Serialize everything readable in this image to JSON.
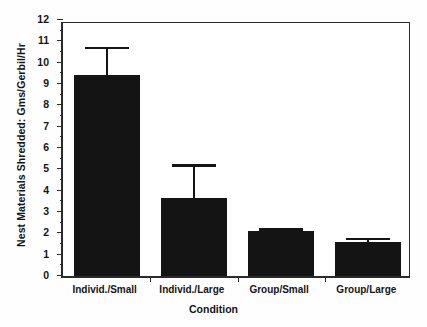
{
  "chart_data": {
    "type": "bar",
    "title": "",
    "xlabel": "Condition",
    "ylabel": "Nest Materials Shredded: Gms/Gerbil/Hr",
    "categories": [
      "Individ./Small",
      "Individ./Large",
      "Group/Small",
      "Group/Large"
    ],
    "values": [
      9.4,
      3.65,
      2.1,
      1.6
    ],
    "error_high": [
      10.75,
      5.25,
      2.25,
      1.8
    ],
    "error_bars": [
      1.35,
      1.6,
      0.15,
      0.2
    ],
    "ylim": [
      0,
      12
    ],
    "yticks": [
      0,
      1,
      2,
      3,
      4,
      5,
      6,
      7,
      8,
      9,
      10,
      11,
      12
    ],
    "ytick_labels": [
      "0",
      "1",
      "2",
      "3",
      "4",
      "5",
      "6",
      "7",
      "8",
      "9",
      "10",
      "11",
      "12"
    ],
    "minor_tick_step": 0.5,
    "grid": false,
    "legend": false,
    "bar_color": "#141414",
    "axis_color": "#2b2b2b",
    "background": "#ffffff"
  }
}
